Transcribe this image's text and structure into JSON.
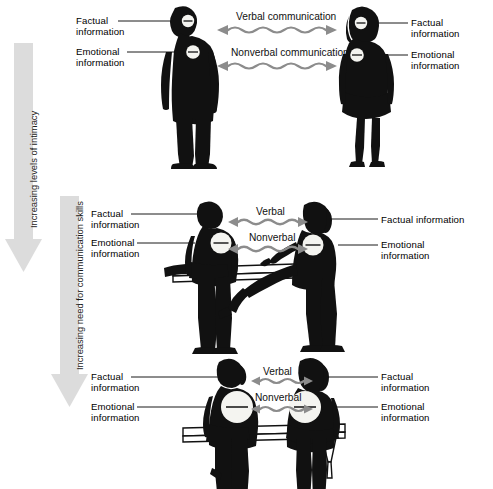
{
  "figure": {
    "background_color": "#ffffff",
    "silhouette_color": "#111111",
    "arrow_color": "#8c8c8c",
    "leader_line_color": "#1a1a1a",
    "disclosure_circle_color": "#f2f2ee"
  },
  "vertical_arrows": [
    {
      "name": "intimacy-arrow",
      "label": "Increasing levels of intimacy",
      "color": "#d9d9d9"
    },
    {
      "name": "communication-skills-arrow",
      "label": "Increasing need for communication skills",
      "color": "#d9d9d9"
    }
  ],
  "panels": [
    {
      "id": "standing",
      "name": "standing-pair-panel",
      "scene": "two people standing and facing each other",
      "left_person": {
        "name": "standing-man-silhouette",
        "pose": "standing",
        "labels": {
          "factual": "Factual\ninformation",
          "emotional": "Emotional\ninformation"
        },
        "disclosure": {
          "factual_circle_size": "small",
          "emotional_circle_size": "small"
        }
      },
      "right_person": {
        "name": "standing-woman-silhouette",
        "pose": "standing",
        "labels": {
          "factual": "Factual\ninformation",
          "emotional": "Emotional\ninformation"
        },
        "disclosure": {
          "factual_circle_size": "small",
          "emotional_circle_size": "small"
        }
      },
      "channels": [
        {
          "name": "verbal-channel",
          "label": "Verbal communication"
        },
        {
          "name": "nonverbal-channel",
          "label": "Nonverbal communication"
        }
      ]
    },
    {
      "id": "bench-apart",
      "name": "bench-seated-apart-panel",
      "scene": "two people seated apart on a bench",
      "left_person": {
        "name": "seated-man-silhouette",
        "pose": "seated",
        "labels": {
          "factual": "Factual\ninformation",
          "emotional": "Emotional\ninformation"
        },
        "disclosure": {
          "factual_circle_size": "none",
          "emotional_circle_size": "medium"
        }
      },
      "right_person": {
        "name": "seated-woman-silhouette",
        "pose": "seated",
        "labels": {
          "factual": "Factual information",
          "emotional": "Emotional\ninformation"
        },
        "disclosure": {
          "factual_circle_size": "none",
          "emotional_circle_size": "medium"
        }
      },
      "channels": [
        {
          "name": "verbal-channel",
          "label": "Verbal"
        },
        {
          "name": "nonverbal-channel",
          "label": "Nonverbal"
        }
      ]
    },
    {
      "id": "bench-close",
      "name": "bench-seated-close-panel",
      "scene": "two people seated close together on a bench",
      "left_person": {
        "name": "seated-close-man-silhouette",
        "pose": "seated",
        "labels": {
          "factual": "Factual\ninformation",
          "emotional": "Emotional\ninformation"
        },
        "disclosure": {
          "factual_circle_size": "none",
          "emotional_circle_size": "large"
        }
      },
      "right_person": {
        "name": "seated-close-woman-silhouette",
        "pose": "seated",
        "labels": {
          "factual": "Factual\ninformation",
          "emotional": "Emotional\ninformation"
        },
        "disclosure": {
          "factual_circle_size": "none",
          "emotional_circle_size": "large"
        }
      },
      "channels": [
        {
          "name": "verbal-channel",
          "label": "Verbal"
        },
        {
          "name": "nonverbal-channel",
          "label": "Nonverbal"
        }
      ]
    }
  ]
}
